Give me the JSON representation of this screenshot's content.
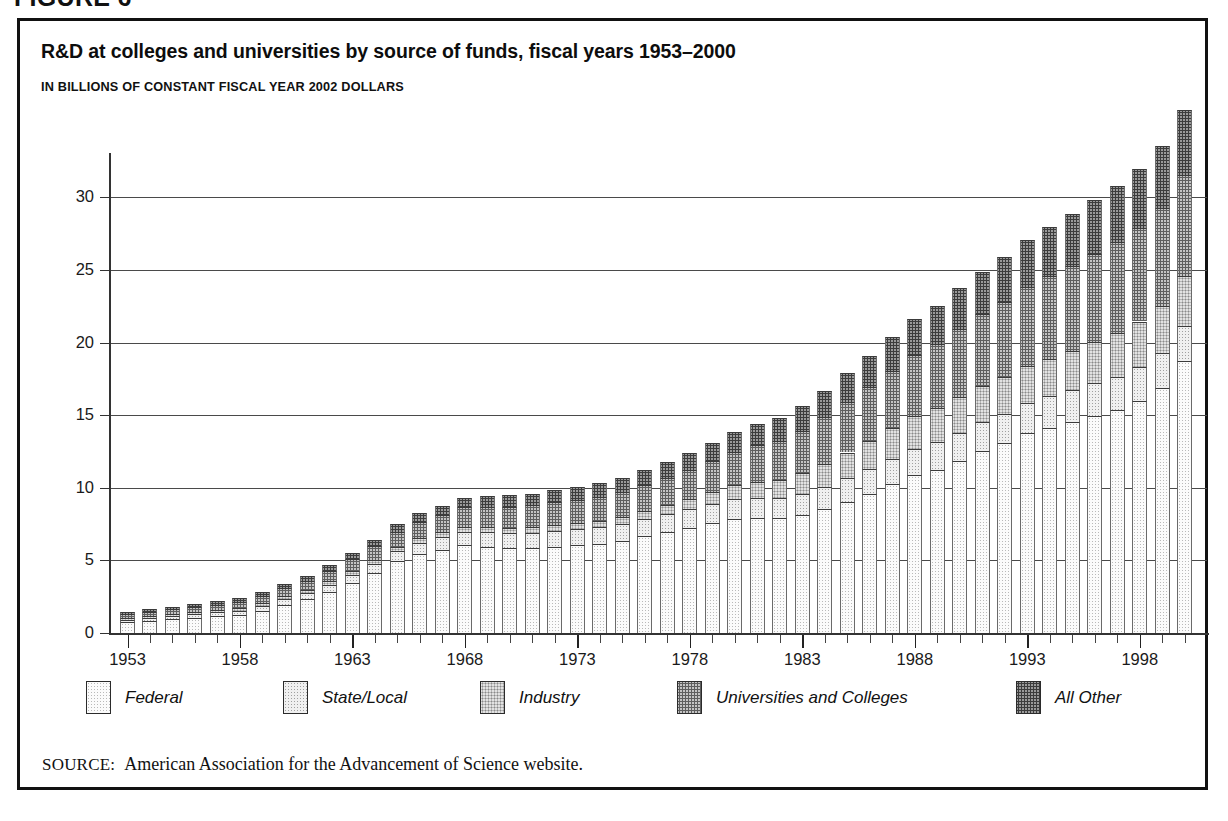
{
  "figure_number": "FIGURE 6",
  "title": "R&D at colleges and universities by source of funds, fiscal years 1953–2000",
  "subtitle": "IN BILLIONS OF CONSTANT FISCAL YEAR 2002 DOLLARS",
  "source": {
    "label": "SOURCE:",
    "text": "American Association for the Advancement of Science website."
  },
  "legend": [
    {
      "label": "Federal",
      "pattern": "p0",
      "color": "#fbfbfb"
    },
    {
      "label": "State/Local",
      "pattern": "p1",
      "color": "#f0f0f0"
    },
    {
      "label": "Industry",
      "pattern": "p2",
      "color": "#e2e2e2"
    },
    {
      "label": "Universities and Colleges",
      "pattern": "p3",
      "color": "#c4c4c4"
    },
    {
      "label": "All Other",
      "pattern": "p4",
      "color": "#9a9a9a"
    }
  ],
  "chart_data": {
    "type": "bar",
    "stacked": true,
    "title": "R&D at colleges and universities by source of funds, fiscal years 1953–2000",
    "subtitle": "IN BILLIONS OF CONSTANT FISCAL YEAR 2002 DOLLARS",
    "xlabel": "",
    "ylabel": "",
    "units": "billions of constant fiscal year 2002 dollars",
    "ylim": [
      0,
      32.5
    ],
    "yticks": [
      0,
      5,
      10,
      15,
      20,
      25,
      30
    ],
    "ytick_labels": [
      "0",
      "5",
      "10",
      "15",
      "20",
      "25",
      "30"
    ],
    "grid": true,
    "legend_position": "bottom",
    "x_major_ticks": [
      1953,
      1958,
      1963,
      1968,
      1973,
      1978,
      1983,
      1988,
      1993,
      1998
    ],
    "x_major_tick_labels": [
      "1953",
      "1958",
      "1963",
      "1968",
      "1973",
      "1978",
      "1983",
      "1988",
      "1993",
      "1998"
    ],
    "categories": [
      1953,
      1954,
      1955,
      1956,
      1957,
      1958,
      1959,
      1960,
      1961,
      1962,
      1963,
      1964,
      1965,
      1966,
      1967,
      1968,
      1969,
      1970,
      1971,
      1972,
      1973,
      1974,
      1975,
      1976,
      1977,
      1978,
      1979,
      1980,
      1981,
      1982,
      1983,
      1984,
      1985,
      1986,
      1987,
      1988,
      1989,
      1990,
      1991,
      1992,
      1993,
      1994,
      1995,
      1996,
      1997,
      1998,
      1999,
      2000
    ],
    "series": [
      {
        "name": "Federal",
        "pattern": "p0",
        "values": [
          0.75,
          0.85,
          0.95,
          1.05,
          1.15,
          1.25,
          1.55,
          1.95,
          2.35,
          2.85,
          3.45,
          4.15,
          4.95,
          5.45,
          5.75,
          6.05,
          5.95,
          5.85,
          5.85,
          5.95,
          6.05,
          6.15,
          6.35,
          6.65,
          6.95,
          7.25,
          7.55,
          7.85,
          7.95,
          7.9,
          8.15,
          8.55,
          9.05,
          9.6,
          10.25,
          10.85,
          11.25,
          11.85,
          12.5,
          13.05,
          13.75,
          14.15,
          14.55,
          14.95,
          15.35,
          15.95,
          16.85,
          18.7
        ]
      },
      {
        "name": "State/Local",
        "pattern": "p1",
        "values": [
          0.18,
          0.2,
          0.22,
          0.24,
          0.27,
          0.3,
          0.34,
          0.38,
          0.42,
          0.48,
          0.55,
          0.62,
          0.7,
          0.78,
          0.85,
          0.92,
          0.98,
          1.02,
          1.05,
          1.08,
          1.1,
          1.12,
          1.15,
          1.18,
          1.22,
          1.26,
          1.3,
          1.35,
          1.38,
          1.4,
          1.45,
          1.52,
          1.6,
          1.68,
          1.75,
          1.82,
          1.88,
          1.95,
          2.0,
          2.05,
          2.1,
          2.15,
          2.2,
          2.25,
          2.3,
          2.35,
          2.4,
          2.45
        ]
      },
      {
        "name": "Industry",
        "pattern": "p2",
        "values": [
          0.1,
          0.11,
          0.12,
          0.13,
          0.14,
          0.15,
          0.17,
          0.19,
          0.21,
          0.23,
          0.26,
          0.28,
          0.3,
          0.32,
          0.34,
          0.36,
          0.37,
          0.38,
          0.39,
          0.41,
          0.43,
          0.46,
          0.5,
          0.56,
          0.63,
          0.72,
          0.83,
          0.96,
          1.1,
          1.25,
          1.42,
          1.6,
          1.78,
          1.95,
          2.1,
          2.25,
          2.35,
          2.45,
          2.5,
          2.52,
          2.55,
          2.6,
          2.7,
          2.85,
          3.0,
          3.15,
          3.3,
          3.45
        ]
      },
      {
        "name": "Universities and Colleges",
        "pattern": "p3",
        "values": [
          0.28,
          0.3,
          0.33,
          0.36,
          0.4,
          0.44,
          0.5,
          0.56,
          0.63,
          0.72,
          0.82,
          0.92,
          1.02,
          1.12,
          1.22,
          1.32,
          1.4,
          1.46,
          1.5,
          1.55,
          1.6,
          1.66,
          1.72,
          1.8,
          1.9,
          2.02,
          2.16,
          2.32,
          2.5,
          2.7,
          2.92,
          3.18,
          3.45,
          3.7,
          3.95,
          4.2,
          4.45,
          4.7,
          4.95,
          5.2,
          5.45,
          5.65,
          5.85,
          6.05,
          6.25,
          6.45,
          6.7,
          6.95
        ]
      },
      {
        "name": "All Other",
        "pattern": "p4",
        "values": [
          0.14,
          0.16,
          0.18,
          0.2,
          0.22,
          0.24,
          0.27,
          0.3,
          0.33,
          0.37,
          0.42,
          0.47,
          0.52,
          0.57,
          0.62,
          0.67,
          0.72,
          0.76,
          0.8,
          0.84,
          0.88,
          0.93,
          0.98,
          1.04,
          1.1,
          1.18,
          1.26,
          1.36,
          1.46,
          1.57,
          1.7,
          1.84,
          2.0,
          2.16,
          2.32,
          2.48,
          2.62,
          2.78,
          2.92,
          3.06,
          3.22,
          3.38,
          3.55,
          3.72,
          3.9,
          4.08,
          4.28,
          4.48
        ]
      }
    ],
    "totals": [
      1.45,
      1.62,
      1.8,
      1.98,
      2.18,
      2.38,
      2.83,
      3.38,
      3.94,
      4.65,
      5.5,
      6.44,
      7.49,
      8.24,
      8.78,
      9.32,
      9.42,
      9.47,
      9.59,
      9.83,
      10.06,
      10.32,
      10.7,
      11.23,
      11.8,
      12.43,
      13.1,
      13.84,
      14.39,
      14.82,
      15.64,
      16.69,
      17.88,
      19.09,
      20.37,
      21.6,
      22.55,
      23.73,
      24.87,
      25.88,
      27.07,
      27.93,
      28.85,
      29.82,
      30.8,
      31.98,
      33.53,
      36.03
    ]
  }
}
